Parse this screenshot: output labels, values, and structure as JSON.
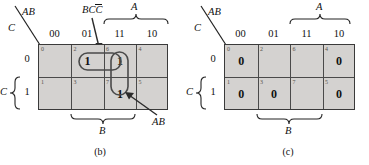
{
  "figure_b": {
    "caption": "(b)",
    "axis": {
      "top_label": "AB",
      "left_label": "C",
      "row_group_label": "C",
      "col_group_A": "A",
      "col_group_B": "B"
    },
    "col_headers": [
      "00",
      "01",
      "11",
      "10"
    ],
    "row_headers": [
      "0",
      "1"
    ],
    "cells": [
      {
        "index": "0",
        "value": "",
        "row": 0,
        "col": 0
      },
      {
        "index": "2",
        "value": "1",
        "row": 0,
        "col": 1
      },
      {
        "index": "6",
        "value": "1",
        "row": 0,
        "col": 2
      },
      {
        "index": "4",
        "value": "",
        "row": 0,
        "col": 3
      },
      {
        "index": "1",
        "value": "",
        "row": 1,
        "col": 0
      },
      {
        "index": "3",
        "value": "",
        "row": 1,
        "col": 1
      },
      {
        "index": "7",
        "value": "1",
        "row": 1,
        "col": 2
      },
      {
        "index": "5",
        "value": "",
        "row": 1,
        "col": 3
      }
    ],
    "annotations": {
      "group_bc_label": "BC",
      "group_bc_overbar": "C",
      "group_ab_label": "AB"
    }
  },
  "figure_c": {
    "caption": "(c)",
    "axis": {
      "top_label": "AB",
      "left_label": "C",
      "row_group_label": "C",
      "col_group_A": "A",
      "col_group_B": "B"
    },
    "col_headers": [
      "00",
      "01",
      "11",
      "10"
    ],
    "row_headers": [
      "0",
      "1"
    ],
    "cells": [
      {
        "index": "0",
        "value": "0",
        "row": 0,
        "col": 0
      },
      {
        "index": "2",
        "value": "",
        "row": 0,
        "col": 1
      },
      {
        "index": "6",
        "value": "",
        "row": 0,
        "col": 2
      },
      {
        "index": "4",
        "value": "0",
        "row": 0,
        "col": 3
      },
      {
        "index": "1",
        "value": "0",
        "row": 1,
        "col": 0
      },
      {
        "index": "3",
        "value": "0",
        "row": 1,
        "col": 1
      },
      {
        "index": "7",
        "value": "",
        "row": 1,
        "col": 2
      },
      {
        "index": "5",
        "value": "0",
        "row": 1,
        "col": 3
      }
    ]
  },
  "colors": {
    "cell_fill": "#d4d2d0",
    "grid_line": "#4a4a4a",
    "border": "#3a3a3a",
    "text": "#111111",
    "index_text": "#58554f"
  }
}
